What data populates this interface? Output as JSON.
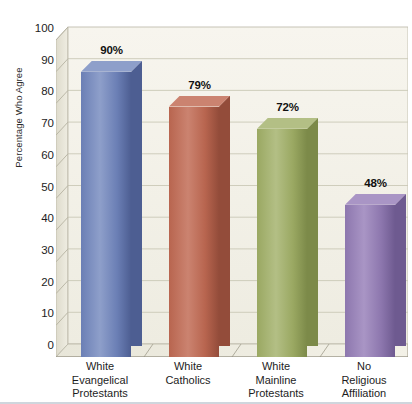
{
  "chart_data": {
    "type": "bar",
    "title": "",
    "subtitle": "",
    "xlabel": "",
    "ylabel": "Percentage Who Agree",
    "categories": [
      "White Evangelical Protestants",
      "White Catholics",
      "White Mainline Protestants",
      "No Religious Affiliation"
    ],
    "category_lines": [
      [
        "White",
        "Evangelical",
        "Protestants"
      ],
      [
        "White",
        "Catholics"
      ],
      [
        "White",
        "Mainline",
        "Protestants"
      ],
      [
        "No",
        "Religious",
        "Affiliation"
      ]
    ],
    "values": [
      90,
      79,
      72,
      48
    ],
    "value_labels": [
      "90%",
      "79%",
      "72%",
      "48%"
    ],
    "ylim": [
      0,
      100
    ],
    "y_ticks": [
      100,
      90,
      80,
      70,
      60,
      50,
      40,
      30,
      20,
      10,
      0
    ],
    "y_tick_labels": [
      "100",
      "90",
      "80",
      "70",
      "60",
      "50",
      "40",
      "30",
      "20",
      "10",
      "0"
    ],
    "grid": true,
    "grid_axis": "y",
    "legend": "none",
    "style": "3d-columns",
    "bar_colors": [
      "#6b7fb5",
      "#b8654f",
      "#9aa862",
      "#8d77ae"
    ],
    "bar_side_colors": [
      "#4d5e92",
      "#934c3a",
      "#7c8a49",
      "#6e5a90"
    ],
    "bar_top_colors": [
      "#8e9fca",
      "#cb8370",
      "#b3bf85",
      "#a995c5"
    ],
    "plot_background": "#f3f1e8",
    "grid_color": "#c8c5b4",
    "axis_color": "#8d8a7c",
    "page_background": "#ffffff"
  }
}
